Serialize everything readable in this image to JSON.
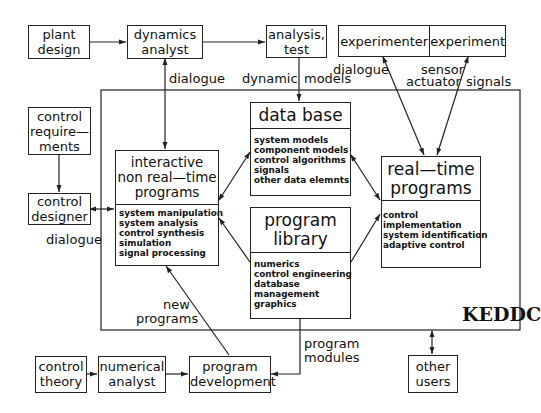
{
  "diagram": {
    "system_name": "KEDDC",
    "boxes": {
      "plant_design": [
        "plant",
        "design"
      ],
      "dynamics_analyst": [
        "dynamics",
        "analyst"
      ],
      "analysis_test": [
        "analysis,",
        "test"
      ],
      "experimenter": "experimenter",
      "experiment": "experiment",
      "control_requirements": [
        "control",
        "require—",
        "ments"
      ],
      "control_designer": [
        "control",
        "designer"
      ],
      "interactive": {
        "title": [
          "interactive",
          "non real—time",
          "programs"
        ],
        "items": [
          "system manipulation",
          "system analysis",
          "control synthesis",
          "simulation",
          "signal processing"
        ]
      },
      "data_base": {
        "title": [
          "data base"
        ],
        "items": [
          "system models",
          "component models",
          "control algorithms",
          "signals",
          "other data elemnts"
        ]
      },
      "program_library": {
        "title": [
          "program",
          "library"
        ],
        "items": [
          "numerics",
          "control engineering",
          "database",
          "management",
          "graphics"
        ]
      },
      "real_time": {
        "title": [
          "real—time",
          "programs"
        ],
        "items": [
          "control",
          "implementation",
          "system identification",
          "adaptive control"
        ]
      },
      "control_theory": [
        "control",
        "theory"
      ],
      "numerical_analyst": [
        "numerical",
        "analyst"
      ],
      "program_development": [
        "program",
        "development"
      ],
      "other_users": [
        "other",
        "users"
      ]
    },
    "edge_labels": {
      "dialogue_top": "dialogue",
      "dynamic": "dynamic",
      "models": "models",
      "dialogue_right": "dialogue",
      "sensor": "sensor",
      "actuator": "actuator",
      "signals": "signals",
      "dialogue_left": "dialogue",
      "new": "new",
      "programs": "programs",
      "program_modules_1": "program",
      "program_modules_2": "modules"
    }
  }
}
